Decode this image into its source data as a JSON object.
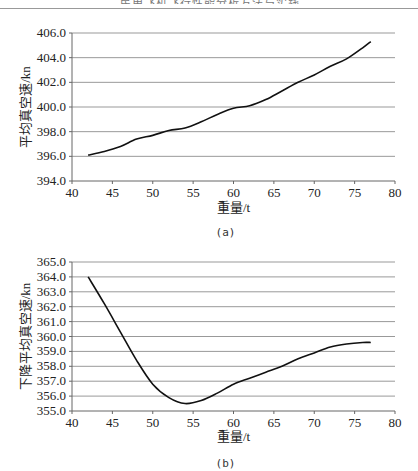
{
  "page": {
    "header_text": "民用飞机飞行性能分析方法与实践"
  },
  "chart_data": [
    {
      "id": "a",
      "type": "line",
      "caption": "(a)",
      "title": "",
      "xlabel": "重量/t",
      "ylabel": "平均真空速/kn",
      "xlim": [
        40,
        80
      ],
      "ylim": [
        394.0,
        406.0
      ],
      "xticks": [
        "40",
        "45",
        "50",
        "55",
        "60",
        "65",
        "70",
        "75",
        "80"
      ],
      "yticks": [
        "394.0",
        "396.0",
        "398.0",
        "400.0",
        "402.0",
        "404.0",
        "406.0"
      ],
      "grid": "horizontal",
      "legend": "none",
      "x": [
        42,
        44,
        46,
        48,
        50,
        52,
        54,
        56,
        58,
        60,
        62,
        64,
        66,
        68,
        70,
        72,
        74,
        76,
        77
      ],
      "series": [
        {
          "name": "平均真空速",
          "values": [
            396.1,
            396.4,
            396.8,
            397.4,
            397.7,
            398.1,
            398.3,
            398.8,
            399.4,
            399.9,
            400.1,
            400.6,
            401.3,
            402.0,
            402.6,
            403.3,
            403.9,
            404.8,
            405.3
          ]
        }
      ]
    },
    {
      "id": "b",
      "type": "line",
      "caption": "(b)",
      "title": "",
      "xlabel": "重量/t",
      "ylabel": "下降平均真空速/kn",
      "xlim": [
        40,
        80
      ],
      "ylim": [
        355.0,
        365.0
      ],
      "xticks": [
        "40",
        "45",
        "50",
        "55",
        "60",
        "65",
        "70",
        "75",
        "80"
      ],
      "yticks": [
        "355.0",
        "356.0",
        "357.0",
        "358.0",
        "359.0",
        "360.0",
        "361.0",
        "362.0",
        "363.0",
        "364.0",
        "365.0"
      ],
      "grid": "horizontal",
      "legend": "none",
      "x": [
        42,
        44,
        46,
        48,
        50,
        52,
        54,
        56,
        58,
        60,
        62,
        64,
        66,
        68,
        70,
        72,
        74,
        76,
        77
      ],
      "series": [
        {
          "name": "下降平均真空速",
          "values": [
            364.0,
            362.2,
            360.3,
            358.4,
            356.8,
            355.9,
            355.5,
            355.7,
            356.2,
            356.8,
            357.2,
            357.6,
            358.0,
            358.5,
            358.9,
            359.3,
            359.5,
            359.6,
            359.6
          ]
        }
      ]
    }
  ]
}
